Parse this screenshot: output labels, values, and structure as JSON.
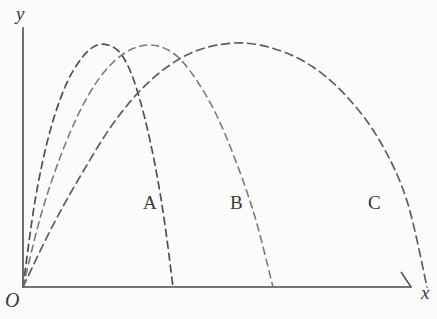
{
  "figure": {
    "kind": "line",
    "background_color": "#fbfbfa",
    "axis_color": "#4a4a4a",
    "curve_color": "#555555"
  },
  "axes": {
    "y_axis_label": "y",
    "x_axis_label": "x",
    "origin_label": "O",
    "y_axis_name": "y-axis",
    "x_axis_name": "x-axis"
  },
  "labels": {
    "curve_a": "A",
    "curve_b": "B",
    "curve_c": "C"
  },
  "chart_data": {
    "type": "line",
    "title": "",
    "xlabel": "x",
    "ylabel": "y",
    "grid": false,
    "legend": "inline-labels",
    "xlim": [
      0,
      410
    ],
    "ylim": [
      0,
      290
    ],
    "series": [
      {
        "name": "A",
        "label": "A",
        "color": "#4f4f4f",
        "dash": "7,5",
        "launch_point": [
          0,
          0
        ],
        "peak": [
          85,
          242
        ],
        "landing": [
          150,
          0
        ],
        "points": [
          [
            0,
            0
          ],
          [
            12,
            86
          ],
          [
            26,
            152
          ],
          [
            42,
            200
          ],
          [
            58,
            228
          ],
          [
            72,
            241
          ],
          [
            85,
            242
          ],
          [
            98,
            233
          ],
          [
            110,
            209
          ],
          [
            122,
            168
          ],
          [
            133,
            117
          ],
          [
            142,
            62
          ],
          [
            150,
            0
          ]
        ]
      },
      {
        "name": "B",
        "label": "B",
        "color": "#7b7b7b",
        "dash": "7,5",
        "launch_point": [
          0,
          0
        ],
        "peak": [
          128,
          242
        ],
        "landing": [
          250,
          0
        ],
        "points": [
          [
            0,
            0
          ],
          [
            18,
            72
          ],
          [
            38,
            132
          ],
          [
            60,
            182
          ],
          [
            82,
            216
          ],
          [
            105,
            236
          ],
          [
            128,
            242
          ],
          [
            150,
            234
          ],
          [
            170,
            212
          ],
          [
            192,
            175
          ],
          [
            212,
            128
          ],
          [
            232,
            70
          ],
          [
            250,
            0
          ]
        ]
      },
      {
        "name": "C",
        "label": "C",
        "color": "#5e5e5e",
        "dash": "8,5",
        "launch_point": [
          0,
          0
        ],
        "peak": [
          212,
          244
        ],
        "landing": [
          404,
          0
        ],
        "points": [
          [
            0,
            0
          ],
          [
            28,
            58
          ],
          [
            58,
            112
          ],
          [
            92,
            166
          ],
          [
            128,
            207
          ],
          [
            168,
            234
          ],
          [
            212,
            244
          ],
          [
            252,
            238
          ],
          [
            290,
            220
          ],
          [
            326,
            188
          ],
          [
            358,
            144
          ],
          [
            384,
            86
          ],
          [
            404,
            0
          ]
        ]
      }
    ]
  }
}
